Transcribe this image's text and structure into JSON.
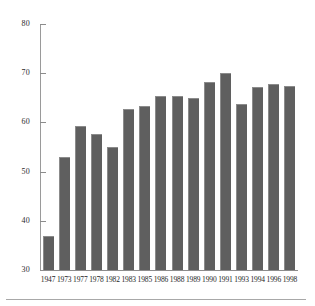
{
  "chart_data": {
    "type": "bar",
    "title": "",
    "subtitle": "",
    "xlabel": "",
    "ylabel": "",
    "categories": [
      "1947",
      "1973",
      "1977",
      "1978",
      "1982",
      "1983",
      "1985",
      "1986",
      "1988",
      "1989",
      "1990",
      "1991",
      "1993",
      "1994",
      "1996",
      "1998"
    ],
    "values": [
      37.0,
      53.0,
      59.3,
      57.7,
      55.1,
      62.7,
      63.4,
      65.4,
      65.4,
      65.0,
      68.2,
      70.0,
      63.7,
      67.2,
      67.8,
      67.5
    ],
    "ylim": [
      30,
      80
    ],
    "yticks": [
      80,
      70,
      60,
      50,
      40,
      30
    ],
    "ytick_labels": [
      "80",
      "70",
      "60",
      "50",
      "40",
      "30"
    ],
    "xtick_labels": [
      "1947",
      "1973",
      "1977",
      "1978",
      "1982",
      "1983",
      "1985",
      "1986",
      "1988",
      "1989",
      "1990",
      "1991",
      "1993",
      "1994",
      "1996",
      "1998"
    ],
    "grid": false,
    "legend": null,
    "legend_position": "none",
    "annotations": [],
    "series": [
      {
        "name": "",
        "values": [
          37.0,
          53.0,
          59.3,
          57.7,
          55.1,
          62.7,
          63.4,
          65.4,
          65.4,
          65.0,
          68.2,
          70.0,
          63.7,
          67.2,
          67.8,
          67.5
        ]
      }
    ]
  },
  "style": {
    "bar_color": "#5f5f5f",
    "bar_edge_color": "#8b8b8b",
    "axis_color": "#8c8c8c",
    "text_color": "#1e1e1e",
    "background": "#ffffff",
    "footer_rule_color": "#a8a8a8"
  }
}
